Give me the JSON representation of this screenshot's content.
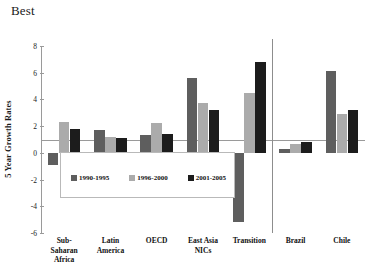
{
  "chart_data": {
    "type": "bar",
    "title": "Best",
    "xlabel": "",
    "ylabel": "5 Year Growth Rates",
    "ylim": [
      -6,
      8
    ],
    "yticks": [
      8,
      6,
      4,
      2,
      0,
      -2,
      -4,
      -6
    ],
    "grid": false,
    "legend_position": "inside-lower-left",
    "categories": [
      "Sub-Saharan Africa",
      "Latin America",
      "OECD",
      "East Asia NICs",
      "Transition",
      "Brazil",
      "Chile"
    ],
    "category_lines": [
      [
        "Sub-",
        "Saharan",
        "Africa"
      ],
      [
        "Latin",
        "America"
      ],
      [
        "OECD"
      ],
      [
        "East Asia",
        "NICs"
      ],
      [
        "Transition"
      ],
      [
        "Brazil"
      ],
      [
        "Chile"
      ]
    ],
    "series": [
      {
        "name": "1990-1995",
        "color": "#5e5e5e",
        "values": [
          -0.9,
          1.7,
          1.3,
          5.6,
          -5.2,
          0.3,
          6.1
        ]
      },
      {
        "name": "1996-2000",
        "color": "#ababab",
        "values": [
          2.3,
          1.2,
          2.2,
          3.7,
          4.5,
          0.65,
          2.9
        ]
      },
      {
        "name": "2001-2005",
        "color": "#1c1c1c",
        "values": [
          1.8,
          1.1,
          1.4,
          3.2,
          6.8,
          0.8,
          3.2
        ]
      }
    ],
    "annotations": {
      "separator_after_category": "Transition"
    }
  },
  "legend": {
    "items": [
      {
        "label": "1990-1995",
        "swatch": "dark-gray"
      },
      {
        "label": "1996-2000",
        "swatch": "light-gray"
      },
      {
        "label": "2001-2005",
        "swatch": "black"
      }
    ]
  }
}
